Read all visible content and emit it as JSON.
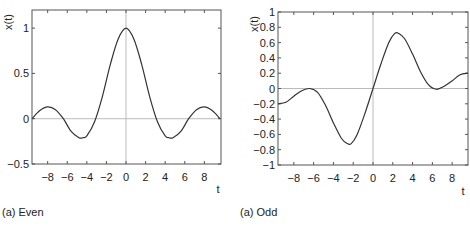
{
  "chart_data": [
    {
      "type": "line",
      "title": "",
      "caption": "(a) Even",
      "xlabel": "t",
      "ylabel": "x(t)",
      "xlim": [
        -9.6,
        9.7
      ],
      "ylim": [
        -0.5,
        1.2
      ],
      "xticks": [
        -8,
        -6,
        -4,
        -2,
        0,
        2,
        4,
        6,
        8
      ],
      "xtick_labels": [
        "−8",
        "−6",
        "−4",
        "−2",
        "0",
        "2",
        "4",
        "6",
        "8"
      ],
      "yticks": [
        -0.5,
        0,
        0.5,
        1
      ],
      "ytick_labels": [
        "−0.5",
        "0",
        "0.5",
        "1"
      ],
      "grid": false,
      "zero_lines": true,
      "series": [
        {
          "name": "x(t)",
          "x": [
            -9.6,
            -8.8,
            -8,
            -7.2,
            -6.4,
            -5.6,
            -4.8,
            -4.4,
            -4,
            -3.2,
            -2.4,
            -1.6,
            -0.8,
            0,
            0.8,
            1.6,
            2.4,
            3.2,
            4,
            4.4,
            4.8,
            5.6,
            6.4,
            7.2,
            8,
            8.8,
            9.6
          ],
          "y": [
            0.0,
            0.09,
            0.13,
            0.1,
            0.0,
            -0.14,
            -0.21,
            -0.21,
            -0.19,
            -0.03,
            0.25,
            0.6,
            0.88,
            1.0,
            0.88,
            0.6,
            0.25,
            -0.03,
            -0.19,
            -0.21,
            -0.21,
            -0.14,
            0.0,
            0.1,
            0.13,
            0.09,
            0.0
          ]
        }
      ]
    },
    {
      "type": "line",
      "title": "",
      "caption": "(a) Odd",
      "xlabel": "t",
      "ylabel": "x(t)",
      "xlim": [
        -9.6,
        9.6
      ],
      "ylim": [
        -1,
        1
      ],
      "xticks": [
        -8,
        -6,
        -4,
        -2,
        0,
        2,
        4,
        6,
        8
      ],
      "xtick_labels": [
        "−8",
        "−6",
        "−4",
        "−2",
        "0",
        "2",
        "4",
        "6",
        "8"
      ],
      "yticks": [
        -1,
        -0.8,
        -0.6,
        -0.4,
        -0.2,
        0,
        0.2,
        0.4,
        0.6,
        0.8,
        1
      ],
      "ytick_labels": [
        "−1",
        "−0.8",
        "−0.6",
        "−0.4",
        "−0.2",
        "0",
        "0.2",
        "0.4",
        "0.6",
        "0.8",
        "1"
      ],
      "grid": false,
      "zero_lines": true,
      "series": [
        {
          "name": "x(t)",
          "x": [
            -9.6,
            -8.8,
            -8,
            -7.2,
            -6.4,
            -5.6,
            -4.8,
            -4,
            -3.2,
            -2.6,
            -2.2,
            -1.6,
            -0.8,
            0,
            0.8,
            1.6,
            2.2,
            2.6,
            3.2,
            4,
            4.8,
            5.6,
            6.4,
            7.2,
            8,
            8.8,
            9.6
          ],
          "y": [
            -0.2,
            -0.18,
            -0.1,
            -0.03,
            0.0,
            -0.05,
            -0.22,
            -0.45,
            -0.65,
            -0.72,
            -0.72,
            -0.6,
            -0.32,
            0.0,
            0.32,
            0.6,
            0.72,
            0.72,
            0.65,
            0.45,
            0.22,
            0.05,
            -0.01,
            0.03,
            0.1,
            0.18,
            0.2
          ]
        }
      ]
    }
  ]
}
